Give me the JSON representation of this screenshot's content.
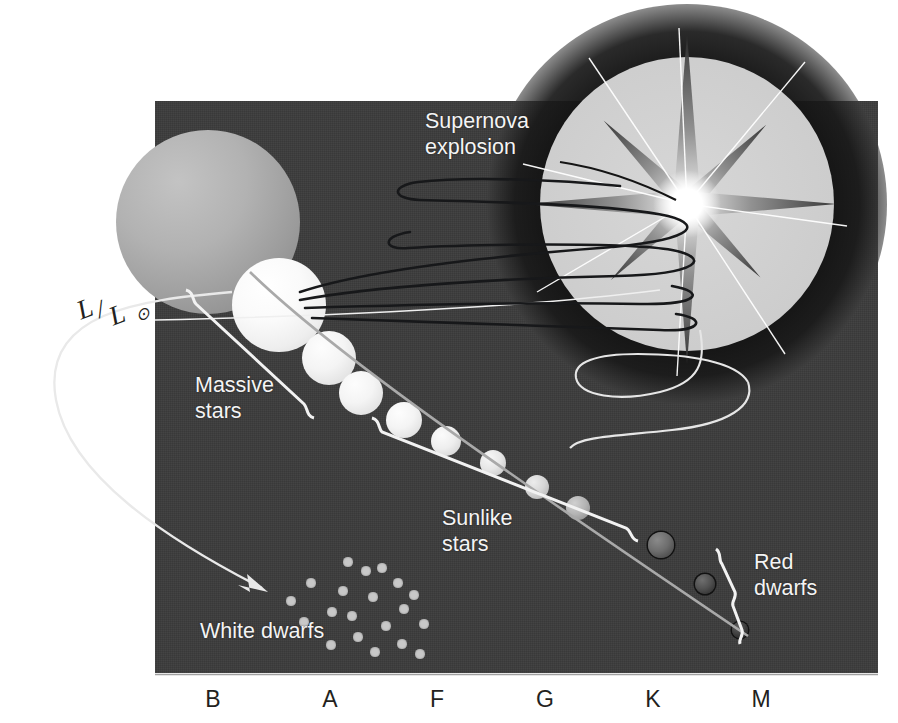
{
  "figure": {
    "kind": "hertzsprung-russell-diagram",
    "background_color": "#ffffff",
    "panel_color": "#3b3b3b",
    "label_color": "#f4f4f4",
    "axis_label_color": "#231f20"
  },
  "y_axis": {
    "name_numerator": "L",
    "name_slash": "/",
    "name_denominator": "L",
    "name_subscript": "⊙",
    "full_label": "L/L⊙"
  },
  "x_axis": {
    "ticks": [
      {
        "label": "B",
        "x": 213
      },
      {
        "label": "A",
        "x": 330
      },
      {
        "label": "F",
        "x": 437
      },
      {
        "label": "G",
        "x": 545
      },
      {
        "label": "K",
        "x": 653
      },
      {
        "label": "M",
        "x": 761
      }
    ]
  },
  "annotations": {
    "supernova": {
      "text": "Supernova\nexplosion"
    },
    "massive_stars": {
      "text": "Massive\nstars"
    },
    "sunlike_stars": {
      "text": "Sunlike\nstars"
    },
    "red_dwarfs": {
      "text": "Red\ndwarfs"
    },
    "white_dwarfs": {
      "text": "White dwarfs"
    }
  },
  "chart_data": {
    "type": "scatter",
    "title": "",
    "xlabel": "Spectral class",
    "ylabel": "L/L⊙",
    "grid": false,
    "legend": "none",
    "x_tick_labels": [
      "B",
      "A",
      "F",
      "G",
      "K",
      "M"
    ],
    "groups": [
      {
        "name": "Massive stars",
        "bracket_x": [
          185,
          345
        ]
      },
      {
        "name": "Sunlike stars",
        "bracket_x": [
          370,
          660
        ]
      },
      {
        "name": "Red dwarfs",
        "bracket_x": [
          690,
          760
        ]
      }
    ],
    "main_sequence_spheres": [
      {
        "cx": 208,
        "cy": 222,
        "r": 92,
        "shade": "giant-gray",
        "note": "red giant / supergiant"
      },
      {
        "cx": 279,
        "cy": 305,
        "r": 47,
        "shade": "bright-white",
        "note": "massive hot star"
      },
      {
        "cx": 329,
        "cy": 358,
        "r": 27,
        "shade": "white"
      },
      {
        "cx": 361,
        "cy": 393,
        "r": 22,
        "shade": "white"
      },
      {
        "cx": 404,
        "cy": 420,
        "r": 18,
        "shade": "white"
      },
      {
        "cx": 446,
        "cy": 441,
        "r": 15,
        "shade": "pale"
      },
      {
        "cx": 493,
        "cy": 463,
        "r": 13,
        "shade": "pale-warm"
      },
      {
        "cx": 537,
        "cy": 487,
        "r": 12,
        "shade": "warm"
      },
      {
        "cx": 578,
        "cy": 508,
        "r": 12,
        "shade": "mid-gray"
      },
      {
        "cx": 661,
        "cy": 545,
        "r": 13,
        "shade": "dark"
      },
      {
        "cx": 705,
        "cy": 584,
        "r": 10,
        "shade": "darker"
      },
      {
        "cx": 740,
        "cy": 630,
        "r": 8,
        "shade": "darkest"
      }
    ],
    "white_dwarf_points": [
      {
        "x": 291,
        "y": 601
      },
      {
        "x": 311,
        "y": 583
      },
      {
        "x": 332,
        "y": 612
      },
      {
        "x": 304,
        "y": 622
      },
      {
        "x": 343,
        "y": 591
      },
      {
        "x": 352,
        "y": 616
      },
      {
        "x": 366,
        "y": 571
      },
      {
        "x": 373,
        "y": 597
      },
      {
        "x": 386,
        "y": 626
      },
      {
        "x": 398,
        "y": 583
      },
      {
        "x": 404,
        "y": 609
      },
      {
        "x": 358,
        "y": 637
      },
      {
        "x": 331,
        "y": 645
      },
      {
        "x": 375,
        "y": 652
      },
      {
        "x": 382,
        "y": 568
      },
      {
        "x": 414,
        "y": 595
      },
      {
        "x": 424,
        "y": 624
      },
      {
        "x": 348,
        "y": 562
      },
      {
        "x": 402,
        "y": 644
      },
      {
        "x": 420,
        "y": 654
      }
    ]
  }
}
